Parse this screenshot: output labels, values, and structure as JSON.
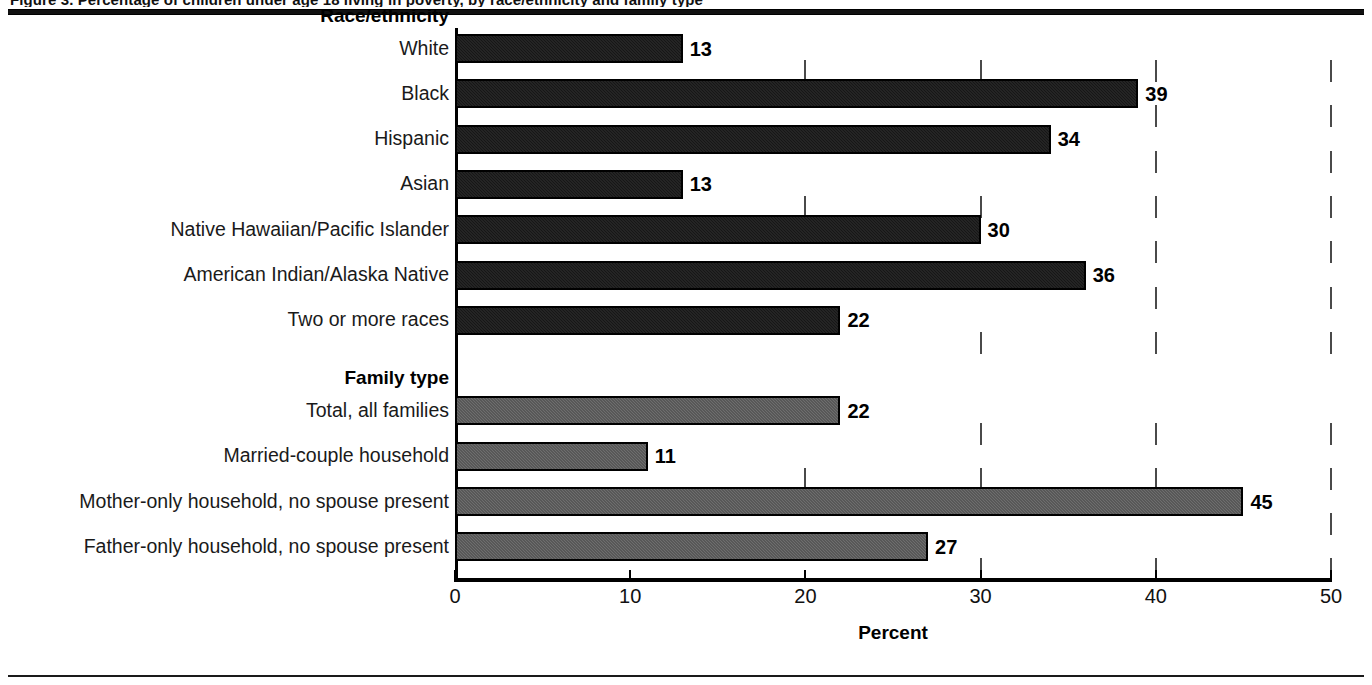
{
  "page": {
    "clipped_header_text": "Figure 3.  Percentage of children under age 18 living in poverty, by race/ethnicity and family type"
  },
  "chart_data": {
    "type": "bar",
    "orientation": "horizontal",
    "title": "",
    "xlabel": "Percent",
    "ylabel": "",
    "xlim": [
      0,
      50
    ],
    "xticks": [
      "0",
      "10",
      "20",
      "30",
      "40",
      "50"
    ],
    "grid": true,
    "legend": "none",
    "colors": {
      "race_ethnicity_bar": "#161616",
      "family_type_bar": "#6e6e6e",
      "axis": "#000000"
    },
    "groups": [
      {
        "name": "Race/ethnicity",
        "style": "dark",
        "categories": [
          "White",
          "Black",
          "Hispanic",
          "Asian",
          "Native Hawaiian/Pacific Islander",
          "American Indian/Alaska Native",
          "Two or more races"
        ],
        "values": [
          13,
          39,
          34,
          13,
          30,
          36,
          22
        ]
      },
      {
        "name": "Family type",
        "style": "gray",
        "categories": [
          "Total, all families",
          "Married-couple household",
          "Mother-only household, no spouse present",
          "Father-only household, no spouse present"
        ],
        "values": [
          22,
          11,
          45,
          27
        ]
      }
    ]
  }
}
